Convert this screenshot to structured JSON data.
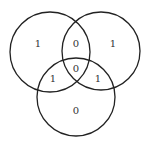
{
  "diagram": {
    "type": "venn-3-set",
    "stroke_color": "#222222",
    "label_color": "#333333",
    "background": "#ffffff",
    "circles": [
      {
        "id": "left",
        "cx": 50,
        "cy": 52,
        "r": 40
      },
      {
        "id": "right",
        "cx": 101,
        "cy": 51,
        "r": 39
      },
      {
        "id": "bottom",
        "cx": 76,
        "cy": 97,
        "r": 39
      }
    ],
    "regions": [
      {
        "id": "left-only",
        "label": "1",
        "x": 38,
        "y": 43
      },
      {
        "id": "left-right",
        "label": "0",
        "x": 76,
        "y": 43
      },
      {
        "id": "right-only",
        "label": "1",
        "x": 113,
        "y": 43
      },
      {
        "id": "left-bottom",
        "label": "1",
        "x": 53,
        "y": 78
      },
      {
        "id": "all-three",
        "label": "0",
        "x": 76,
        "y": 68
      },
      {
        "id": "right-bottom",
        "label": "1",
        "x": 98,
        "y": 78
      },
      {
        "id": "bottom-only",
        "label": "0",
        "x": 76,
        "y": 110
      }
    ]
  }
}
